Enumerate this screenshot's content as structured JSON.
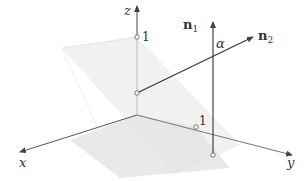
{
  "diagram": {
    "type": "3d-coordinate-planes-with-normals",
    "axes": {
      "x": {
        "label": "x"
      },
      "y": {
        "label": "y"
      },
      "z": {
        "label": "z"
      }
    },
    "ticks": {
      "z_unit": "1",
      "y_unit": "1"
    },
    "vectors": {
      "n1": {
        "label_main": "n",
        "label_sub": "1"
      },
      "n2": {
        "label_main": "n",
        "label_sub": "2"
      }
    },
    "angle": {
      "label": "α"
    },
    "colors": {
      "axis": "#555555",
      "vector": "#333333",
      "plane_vertical": "#eeeeee",
      "plane_horizontal": "#e2e2e2",
      "background": "#ffffff"
    }
  }
}
